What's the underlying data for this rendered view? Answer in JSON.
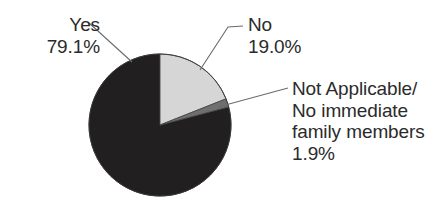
{
  "chart_data": {
    "type": "pie",
    "title": "",
    "subtitle": "",
    "xlabel": "",
    "ylabel": "",
    "legend_position": "none",
    "grid": false,
    "units": "percent",
    "categories": [
      "Yes",
      "No",
      "Not Applicable/No immediate family members"
    ],
    "values": [
      79.1,
      19.0,
      1.9
    ],
    "slices": [
      {
        "name": "Yes",
        "label": "Yes",
        "value": 79.1,
        "value_text": "79.1%",
        "color": "#211f1f",
        "start_angle_deg": 75.2,
        "end_angle_deg": 360.0
      },
      {
        "name": "No",
        "label": "No",
        "value": 19.0,
        "value_text": "19.0%",
        "color": "#d6d6d6",
        "start_angle_deg": 0.0,
        "end_angle_deg": 68.4
      },
      {
        "name": "Not Applicable/No immediate family members",
        "label_lines": [
          "Not Applicable/",
          "No immediate",
          "family members"
        ],
        "value": 1.9,
        "value_text": "1.9%",
        "color": "#6f6f6f",
        "start_angle_deg": 68.4,
        "end_angle_deg": 75.2
      }
    ]
  },
  "labels": {
    "yes": {
      "name": "Yes",
      "percent": "79.1%"
    },
    "no": {
      "name": "No",
      "percent": "19.0%"
    },
    "not_applicable": {
      "line1": "Not Applicable/",
      "line2": "No immediate",
      "line3": "family members",
      "percent": "1.9%"
    }
  },
  "style": {
    "background": "#ffffff",
    "text_color": "#2b2b2b",
    "leader_line_color": "#6b6b6b",
    "slice_outline_color": "#3a3a3a"
  }
}
